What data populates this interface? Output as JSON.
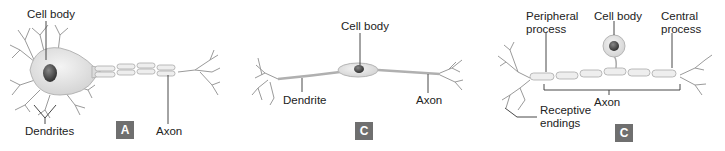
{
  "panels": [
    {
      "id": "A",
      "badge": "A",
      "neuron_type": "multipolar",
      "labels": {
        "cell_body": "Cell body",
        "dendrites": "Dendrites",
        "axon": "Axon"
      }
    },
    {
      "id": "B",
      "badge": "B",
      "neuron_type": "bipolar",
      "labels": {
        "cell_body": "Cell body",
        "dendrite": "Dendrite",
        "axon": "Axon"
      }
    },
    {
      "id": "C",
      "badge": "C",
      "neuron_type": "unipolar",
      "labels": {
        "peripheral_process": "Peripheral process",
        "peripheral_line1": "Peripheral",
        "peripheral_line2": "process",
        "cell_body": "Cell body",
        "central_line1": "Central",
        "central_line2": "process",
        "axon": "Axon",
        "receptive_line1": "Receptive",
        "receptive_line2": "endings"
      }
    }
  ],
  "colors": {
    "badge_bg": "#6f6f6f",
    "cell_fill": "#e4e4e4",
    "nucleus": "#3a3a3a",
    "stroke": "#9a9a9a",
    "leader": "#333333"
  }
}
